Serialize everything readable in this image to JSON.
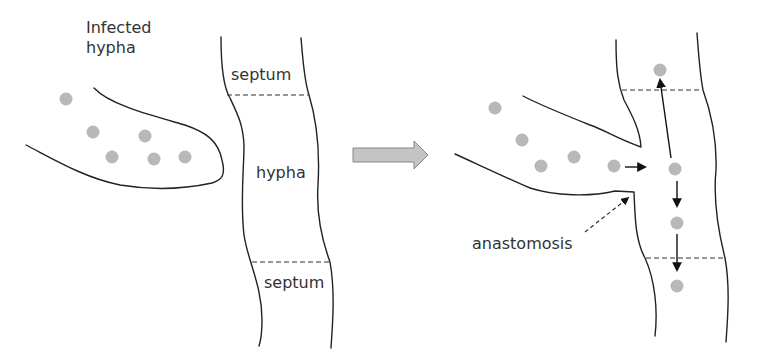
{
  "diagram": {
    "left_panel": {
      "infected_hypha_label": "Infected\nhypha",
      "septum_top_label": "septum",
      "hypha_label": "hypha",
      "septum_bottom_label": "septum"
    },
    "transition_arrow": "block-right-arrow",
    "right_panel": {
      "anastomosis_label": "anastomosis"
    },
    "colors": {
      "outline": "#222222",
      "particle": "#b8b8b8",
      "block_arrow_fill": "#c4c4c4",
      "block_arrow_stroke": "#888888",
      "text": "#333333"
    },
    "particles": {
      "left_count": 6,
      "right_count": 9
    }
  }
}
